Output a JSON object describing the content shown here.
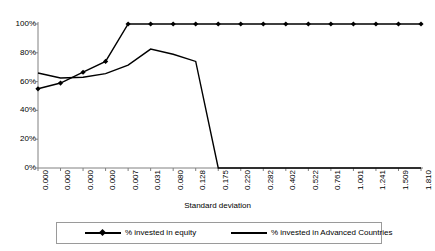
{
  "chart_data": {
    "type": "line",
    "title": "",
    "xlabel": "Standard deviation",
    "ylabel": "",
    "ylim": [
      0,
      1
    ],
    "ytick_labels": [
      "100%",
      "80%",
      "60%",
      "40%",
      "20%",
      "0%"
    ],
    "ytick_values": [
      1.0,
      0.8,
      0.6,
      0.4,
      0.2,
      0.0
    ],
    "grid": false,
    "legend_position": "bottom",
    "categories": [
      "0.000",
      "0.000",
      "0.000",
      "0.000",
      "0.007",
      "0.031",
      "0.080",
      "0.128",
      "0.175",
      "0.220",
      "0.282",
      "0.402",
      "0.522",
      "0.761",
      "1.001",
      "1.241",
      "1.509",
      "1.810"
    ],
    "series": [
      {
        "name": "% invested in equity",
        "marker": "diamond",
        "values": [
          0.55,
          0.59,
          0.665,
          0.74,
          1.0,
          1.0,
          1.0,
          1.0,
          1.0,
          1.0,
          1.0,
          1.0,
          1.0,
          1.0,
          1.0,
          1.0,
          1.0,
          1.0
        ]
      },
      {
        "name": "% invested in Advanced Countries",
        "marker": "none",
        "values": [
          0.66,
          0.625,
          0.63,
          0.655,
          0.715,
          0.826,
          0.79,
          0.74,
          0.0,
          0.0,
          0.0,
          0.0,
          0.0,
          0.0,
          0.0,
          0.0,
          0.0,
          0.0
        ]
      }
    ]
  },
  "legend": {
    "items": [
      {
        "label": "% invested in equity"
      },
      {
        "label": "% invested in Advanced Countries"
      }
    ]
  },
  "colors": {
    "series1": "#000000",
    "series2": "#000000",
    "axis": "#808080",
    "legend_border": "#9a9a9a"
  }
}
